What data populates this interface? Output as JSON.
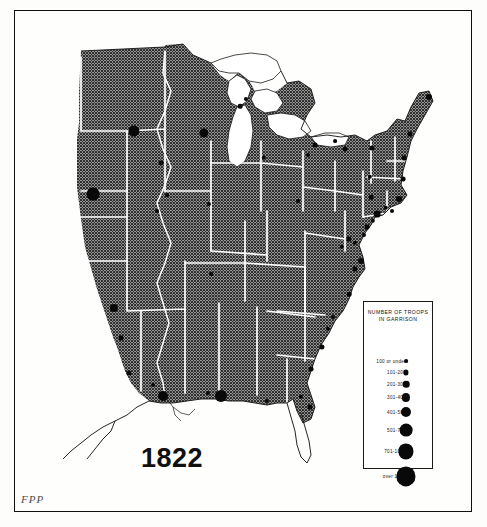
{
  "map": {
    "year_label": "1822",
    "signature": "FPP",
    "water_color": "#ffffff",
    "land_color": "#8d8d8d",
    "border_color": "#12100f",
    "dot_color": "#0a0909",
    "boundary_color": "#ffffff"
  },
  "legend": {
    "title_line1": "NUMBER OF TROOPS",
    "title_line2": "IN GARRISON",
    "entries": [
      {
        "label": "100 or under",
        "radius": 1.9,
        "y": 32
      },
      {
        "label": "101-200",
        "radius": 2.6,
        "y": 43
      },
      {
        "label": "201-300",
        "radius": 3.3,
        "y": 55
      },
      {
        "label": "301-400",
        "radius": 4.1,
        "y": 68
      },
      {
        "label": "401-500",
        "radius": 5.0,
        "y": 83
      },
      {
        "label": "501-700",
        "radius": 6.4,
        "y": 101
      },
      {
        "label": "701-1000",
        "radius": 7.6,
        "y": 122
      },
      {
        "label": "over 1000",
        "radius": 9.6,
        "y": 147
      }
    ]
  },
  "garrisons": [
    {
      "name": "fort-upper-mississippi",
      "x": 119,
      "y": 120,
      "r": 5.6
    },
    {
      "name": "fort-lake-michigan-west",
      "x": 189,
      "y": 122,
      "r": 4.6
    },
    {
      "name": "fort-green-bay",
      "x": 225,
      "y": 95,
      "r": 2.3
    },
    {
      "name": "fort-michilimackinac",
      "x": 231,
      "y": 88,
      "r": 2.1
    },
    {
      "name": "fort-detroit",
      "x": 249,
      "y": 147,
      "r": 2.2
    },
    {
      "name": "fort-missouri-river",
      "x": 78,
      "y": 183,
      "r": 6.4
    },
    {
      "name": "fort-rock-island",
      "x": 146,
      "y": 152,
      "r": 2.4
    },
    {
      "name": "fort-illinois-south",
      "x": 152,
      "y": 184,
      "r": 1.9
    },
    {
      "name": "fort-ohio-valley",
      "x": 194,
      "y": 193,
      "r": 2.1
    },
    {
      "name": "fort-st-louis",
      "x": 142,
      "y": 200,
      "r": 2.0
    },
    {
      "name": "fort-arkansas-post",
      "x": 99,
      "y": 297,
      "r": 4.1
    },
    {
      "name": "fort-red-river",
      "x": 106,
      "y": 327,
      "r": 2.4
    },
    {
      "name": "fort-natchitoches",
      "x": 114,
      "y": 362,
      "r": 2.6
    },
    {
      "name": "fort-new-orleans",
      "x": 148,
      "y": 385,
      "r": 5.0
    },
    {
      "name": "fort-mobile-point",
      "x": 193,
      "y": 382,
      "r": 2.1
    },
    {
      "name": "fort-pensacola",
      "x": 206,
      "y": 385,
      "r": 6.0
    },
    {
      "name": "fort-apalachicola",
      "x": 252,
      "y": 390,
      "r": 2.1
    },
    {
      "name": "fort-st-augustine",
      "x": 295,
      "y": 396,
      "r": 2.6
    },
    {
      "name": "fort-amelia-island",
      "x": 286,
      "y": 386,
      "r": 2.2
    },
    {
      "name": "fort-savannah",
      "x": 296,
      "y": 358,
      "r": 2.4
    },
    {
      "name": "fort-charleston",
      "x": 307,
      "y": 336,
      "r": 2.6
    },
    {
      "name": "fort-georgetown",
      "x": 313,
      "y": 318,
      "r": 2.2
    },
    {
      "name": "fort-cape-fear",
      "x": 318,
      "y": 306,
      "r": 2.0
    },
    {
      "name": "fort-beaufort-nc",
      "x": 334,
      "y": 283,
      "r": 2.3
    },
    {
      "name": "fort-norfolk",
      "x": 340,
      "y": 258,
      "r": 2.6
    },
    {
      "name": "fort-monroe",
      "x": 346,
      "y": 250,
      "r": 3.0
    },
    {
      "name": "fort-washington-dc",
      "x": 327,
      "y": 236,
      "r": 2.2
    },
    {
      "name": "fort-baltimore",
      "x": 334,
      "y": 228,
      "r": 2.6
    },
    {
      "name": "fort-annapolis",
      "x": 340,
      "y": 232,
      "r": 2.2
    },
    {
      "name": "fort-philadelphia",
      "x": 352,
      "y": 216,
      "r": 2.4
    },
    {
      "name": "fort-delaware",
      "x": 349,
      "y": 224,
      "r": 2.0
    },
    {
      "name": "fort-new-york-harbor",
      "x": 362,
      "y": 203,
      "r": 3.4
    },
    {
      "name": "fort-sandy-hook",
      "x": 358,
      "y": 210,
      "r": 2.2
    },
    {
      "name": "fort-new-london",
      "x": 371,
      "y": 197,
      "r": 2.2
    },
    {
      "name": "fort-newport",
      "x": 377,
      "y": 200,
      "r": 2.0
    },
    {
      "name": "fort-boston",
      "x": 384,
      "y": 188,
      "r": 3.0
    },
    {
      "name": "fort-plattsburgh",
      "x": 357,
      "y": 137,
      "r": 2.6
    },
    {
      "name": "fort-sacketts-harbor",
      "x": 330,
      "y": 138,
      "r": 2.4
    },
    {
      "name": "fort-niagara",
      "x": 300,
      "y": 134,
      "r": 2.4
    },
    {
      "name": "fort-buffalo",
      "x": 293,
      "y": 144,
      "r": 2.0
    },
    {
      "name": "fort-oswego",
      "x": 320,
      "y": 130,
      "r": 1.9
    },
    {
      "name": "fort-eastport-maine",
      "x": 414,
      "y": 86,
      "r": 3.0
    },
    {
      "name": "fort-portland-maine",
      "x": 395,
      "y": 123,
      "r": 2.6
    },
    {
      "name": "fort-portsmouth",
      "x": 389,
      "y": 147,
      "r": 2.4
    },
    {
      "name": "fort-hancock-mass",
      "x": 388,
      "y": 168,
      "r": 2.4
    },
    {
      "name": "fort-albany",
      "x": 355,
      "y": 166,
      "r": 2.2
    },
    {
      "name": "fort-west-point",
      "x": 356,
      "y": 186,
      "r": 2.3
    },
    {
      "name": "fort-pittsburgh",
      "x": 283,
      "y": 190,
      "r": 2.0
    },
    {
      "name": "fort-tennessee",
      "x": 196,
      "y": 263,
      "r": 1.9
    },
    {
      "name": "fort-baton-rouge",
      "x": 138,
      "y": 374,
      "r": 2.0
    }
  ]
}
